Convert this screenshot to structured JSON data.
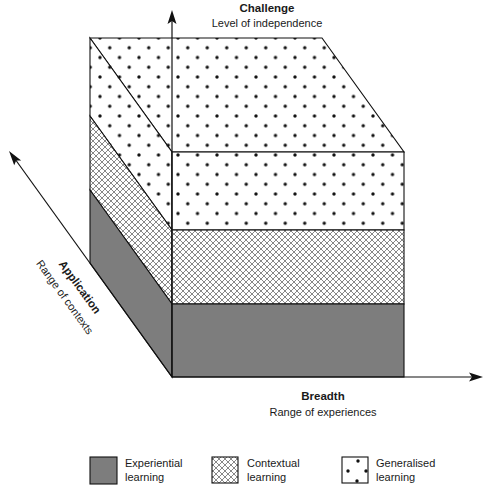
{
  "diagram": {
    "type": "3d-layered-block",
    "axes": {
      "vertical": {
        "title": "Challenge",
        "subtitle": "Level of independence"
      },
      "horizontal": {
        "title": "Breadth",
        "subtitle": "Range of experiences"
      },
      "diagonal": {
        "title": "Application",
        "subtitle": "Range of contexts"
      }
    },
    "layers_bottom_to_top": [
      "Experiential learning",
      "Contextual learning",
      "Generalised learning"
    ]
  },
  "legend": [
    {
      "line1": "Experiential",
      "line2": "learning",
      "pattern": "solid-gray"
    },
    {
      "line1": "Contextual",
      "line2": "learning",
      "pattern": "crosshatch"
    },
    {
      "line1": "Generalised",
      "line2": "learning",
      "pattern": "dots"
    }
  ],
  "colors": {
    "experiential_fill": "#7d7d7d",
    "crosshatch_line": "#555555",
    "dot": "#111111",
    "outline": "#111111",
    "background": "#ffffff"
  }
}
